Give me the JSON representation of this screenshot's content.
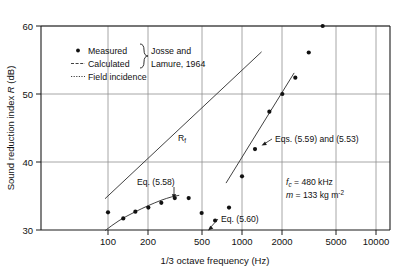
{
  "chart_data": {
    "type": "scatter",
    "title": "",
    "xlabel": "1/3 octave frequency (Hz)",
    "ylabel": "Sound reduction index R (dB)",
    "xscale": "log",
    "xlim": [
      78,
      10000
    ],
    "ylim": [
      30,
      60
    ],
    "xticks": [
      100,
      200,
      500,
      1000,
      2000,
      5000,
      10000
    ],
    "xticklabels": [
      "100",
      "200",
      "500",
      "1000",
      "2000",
      "5000",
      "10000"
    ],
    "yticks": [
      30,
      40,
      50,
      60
    ],
    "yticklabels": [
      "30",
      "40",
      "50",
      "60"
    ],
    "grid": true,
    "legend_position": "upper-left-inside",
    "series": [
      {
        "name": "Measured",
        "type": "scatter",
        "marker": "filled-circle",
        "color": "#111111",
        "x": [
          100,
          130,
          160,
          200,
          250,
          315,
          400,
          500,
          630,
          800,
          1000,
          1250,
          1600,
          2000,
          2500,
          3150
        ],
        "y": [
          32.6,
          31.7,
          32.7,
          33.3,
          34.0,
          34.7,
          34.7,
          32.5,
          31.4,
          33.3,
          37.9,
          41.9,
          47.4,
          50.0,
          52.4,
          56.1
        ],
        "extra_points_x": [
          4000
        ],
        "extra_points_y": [
          60.0
        ]
      },
      {
        "name": "Calculated",
        "type": "line",
        "label": "Eq. (5.58)",
        "color": "#2b2b2b",
        "x": [
          95,
          120,
          160,
          200,
          250,
          300,
          340
        ],
        "y": [
          29.9,
          31.4,
          32.7,
          33.6,
          34.4,
          34.9,
          35.1
        ]
      },
      {
        "name": "Calculated",
        "type": "line",
        "label": "Eqs. (5.59) and (5.53)",
        "color": "#2b2b2b",
        "x": [
          760,
          2450
        ],
        "y": [
          36.9,
          53.1
        ]
      },
      {
        "name": "Field incidence",
        "type": "line",
        "label": "Rf",
        "color": "#2b2b2b",
        "x": [
          95,
          1400
        ],
        "y": [
          34.6,
          56.2
        ]
      }
    ],
    "annotations": [
      {
        "name": "rf-label",
        "text": "R",
        "sub": "f",
        "x": 580,
        "y": 43.9
      },
      {
        "name": "eq-558-label",
        "text": "Eq. (5.58)",
        "x": 245,
        "y": 37.0
      },
      {
        "name": "eq-560-label",
        "text": "Eq. (5.60)",
        "x": 720,
        "y": 31.4
      },
      {
        "name": "eqs-559-553-label",
        "text": "Eqs. (5.59) and (5.53)",
        "x": 1500,
        "y": 43.7
      }
    ],
    "parameter_box": {
      "line1": {
        "symbol": "f",
        "sub": "c",
        "text": " = 480 kHz"
      },
      "line2": {
        "symbol": "m",
        "text": " = 133 kg m",
        "sup": "-2"
      }
    },
    "legend": {
      "entries": [
        {
          "label": "Measured",
          "marker": "dot"
        },
        {
          "label": "Calculated",
          "marker": "dashed-line"
        },
        {
          "label": "Field incidence",
          "marker": "dotted-line"
        }
      ],
      "brace_text_line1": "Josse and",
      "brace_text_line2": "Lamure, 1964"
    }
  },
  "colors": {
    "background": "#ffffff",
    "axis": "#1a1a1a",
    "grid": "#8f8f8f",
    "marker": "#111111",
    "curve": "#2b2b2b"
  }
}
